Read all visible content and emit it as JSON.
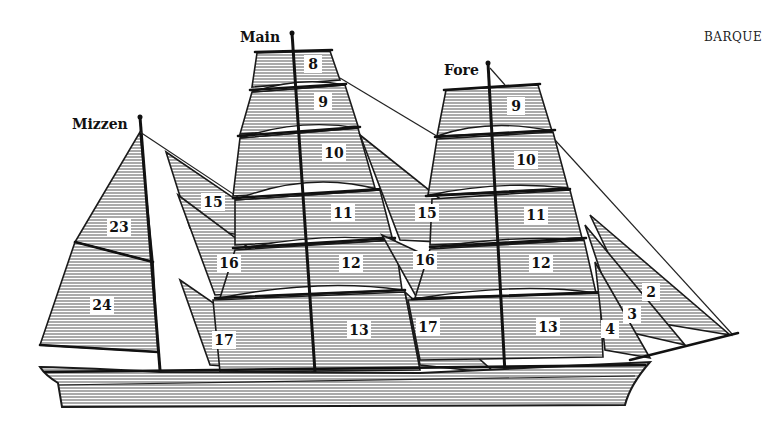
{
  "title": "BARQUE",
  "masts": [
    {
      "name": "Mizzen",
      "x": 72,
      "y": 124
    },
    {
      "name": "Main",
      "x": 240,
      "y": 38
    },
    {
      "name": "Fore",
      "x": 444,
      "y": 70
    }
  ],
  "sail_labels": [
    {
      "id": "8",
      "x": 313,
      "y": 64
    },
    {
      "id": "9",
      "x": 323,
      "y": 102
    },
    {
      "id": "10",
      "x": 334,
      "y": 153
    },
    {
      "id": "11",
      "x": 343,
      "y": 213
    },
    {
      "id": "12",
      "x": 351,
      "y": 263
    },
    {
      "id": "13",
      "x": 359,
      "y": 330
    },
    {
      "id": "15",
      "x": 213,
      "y": 202
    },
    {
      "id": "16",
      "x": 229,
      "y": 263
    },
    {
      "id": "17",
      "x": 224,
      "y": 340
    },
    {
      "id": "23",
      "x": 119,
      "y": 227
    },
    {
      "id": "24",
      "x": 102,
      "y": 305
    },
    {
      "id": "9",
      "x": 516,
      "y": 106
    },
    {
      "id": "10",
      "x": 526,
      "y": 160
    },
    {
      "id": "11",
      "x": 536,
      "y": 215
    },
    {
      "id": "12",
      "x": 541,
      "y": 263
    },
    {
      "id": "13",
      "x": 548,
      "y": 327
    },
    {
      "id": "15",
      "x": 427,
      "y": 213
    },
    {
      "id": "16",
      "x": 425,
      "y": 260
    },
    {
      "id": "17",
      "x": 428,
      "y": 327
    },
    {
      "id": "2",
      "x": 651,
      "y": 292
    },
    {
      "id": "3",
      "x": 632,
      "y": 314
    },
    {
      "id": "4",
      "x": 610,
      "y": 329
    }
  ]
}
